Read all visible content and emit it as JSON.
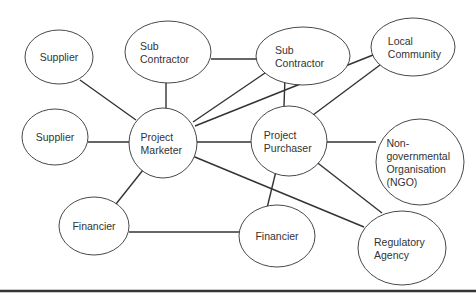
{
  "diagram": {
    "type": "stakeholder-network",
    "nodes": [
      {
        "id": "supplier_1",
        "label": [
          "Supplier"
        ],
        "cx": 59,
        "cy": 57,
        "rx": 34,
        "ry": 27
      },
      {
        "id": "sub_contractor_1",
        "label": [
          "Sub",
          "Contractor"
        ],
        "cx": 168,
        "cy": 52,
        "rx": 43,
        "ry": 31
      },
      {
        "id": "sub_contractor_2",
        "label": [
          "Sub",
          "Contractor"
        ],
        "cx": 303,
        "cy": 56,
        "rx": 47,
        "ry": 29
      },
      {
        "id": "local_community",
        "label": [
          "Local",
          "Community"
        ],
        "cx": 413,
        "cy": 47,
        "rx": 42,
        "ry": 29
      },
      {
        "id": "supplier_2",
        "label": [
          "Supplier"
        ],
        "cx": 55,
        "cy": 137,
        "rx": 33,
        "ry": 28
      },
      {
        "id": "project_marketer",
        "label": [
          "Project",
          "Marketer"
        ],
        "cx": 163,
        "cy": 143,
        "rx": 34,
        "ry": 35
      },
      {
        "id": "project_purchaser",
        "label": [
          "Project",
          "Purchaser"
        ],
        "cx": 289,
        "cy": 141,
        "rx": 38,
        "ry": 35
      },
      {
        "id": "ngo",
        "label": [
          "Non-",
          "governmental",
          "Organisation",
          "(NGO)"
        ],
        "cx": 420,
        "cy": 162,
        "rx": 44,
        "ry": 43
      },
      {
        "id": "financier_1",
        "label": [
          "Financier"
        ],
        "cx": 94,
        "cy": 226,
        "rx": 35,
        "ry": 29
      },
      {
        "id": "financier_2",
        "label": [
          "Financier"
        ],
        "cx": 277,
        "cy": 236,
        "rx": 38,
        "ry": 31
      },
      {
        "id": "regulatory_agency",
        "label": [
          "Regulatory",
          "Agency"
        ],
        "cx": 402,
        "cy": 248,
        "rx": 44,
        "ry": 37
      }
    ],
    "edges": [
      {
        "from": "supplier_1",
        "to": "project_marketer",
        "x1": 80,
        "y1": 80,
        "x2": 136,
        "y2": 120
      },
      {
        "from": "supplier_2",
        "to": "project_marketer",
        "x1": 88,
        "y1": 142,
        "x2": 129,
        "y2": 142
      },
      {
        "from": "sub_contractor_1",
        "to": "project_marketer",
        "x1": 166,
        "y1": 83,
        "x2": 166,
        "y2": 108
      },
      {
        "from": "sub_contractor_1",
        "to": "sub_contractor_2",
        "x1": 211,
        "y1": 59,
        "x2": 257,
        "y2": 59
      },
      {
        "from": "sub_contractor_2",
        "to": "project_marketer",
        "x1": 265,
        "y1": 73,
        "x2": 193,
        "y2": 122
      },
      {
        "from": "local_community",
        "to": "project_marketer",
        "x1": 373,
        "y1": 55,
        "x2": 195,
        "y2": 126
      },
      {
        "from": "sub_contractor_2",
        "to": "project_purchaser",
        "x1": 285,
        "y1": 77,
        "x2": 284,
        "y2": 106
      },
      {
        "from": "local_community",
        "to": "project_purchaser",
        "x1": 380,
        "y1": 65,
        "x2": 313,
        "y2": 115
      },
      {
        "from": "project_marketer",
        "to": "project_purchaser",
        "x1": 197,
        "y1": 142,
        "x2": 251,
        "y2": 142
      },
      {
        "from": "project_purchaser",
        "to": "ngo",
        "x1": 327,
        "y1": 142,
        "x2": 376,
        "y2": 142
      },
      {
        "from": "project_marketer",
        "to": "financier_1",
        "x1": 147,
        "y1": 165,
        "x2": 116,
        "y2": 204
      },
      {
        "from": "project_marketer",
        "to": "regulatory_agency",
        "x1": 190,
        "y1": 155,
        "x2": 364,
        "y2": 227
      },
      {
        "from": "project_purchaser",
        "to": "financier_2",
        "x1": 278,
        "y1": 163,
        "x2": 267,
        "y2": 208
      },
      {
        "from": "project_purchaser",
        "to": "regulatory_agency",
        "x1": 310,
        "y1": 157,
        "x2": 382,
        "y2": 213
      },
      {
        "from": "financier_1",
        "to": "financier_2",
        "x1": 129,
        "y1": 232,
        "x2": 239,
        "y2": 232
      }
    ],
    "bottom_rule": {
      "y": 291,
      "color": "#333333"
    }
  },
  "colors": {
    "stroke": "#333333",
    "edge": "#333333",
    "text": "#333333",
    "background": "#ffffff"
  }
}
